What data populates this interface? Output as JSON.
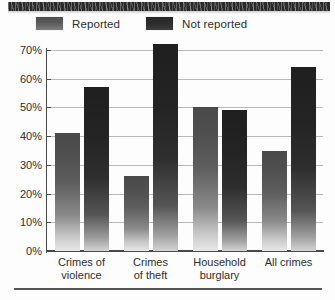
{
  "chart_data": {
    "type": "bar",
    "title": "",
    "subtitle": "",
    "xlabel": "",
    "ylabel": "",
    "categories": [
      "Crimes of violence",
      "Crimes of theft",
      "Household burglary",
      "All crimes"
    ],
    "category_lines": [
      [
        "Crimes of",
        "violence"
      ],
      [
        "Crimes",
        "of theft"
      ],
      [
        "Household",
        "burglary"
      ],
      [
        "All crimes",
        ""
      ]
    ],
    "series": [
      {
        "name": "Reported",
        "values": [
          41,
          26,
          50,
          35
        ],
        "color": "#5a5a5a"
      },
      {
        "name": "Not reported",
        "values": [
          57,
          72,
          49,
          64
        ],
        "color": "#2a2a2a"
      }
    ],
    "ylim": [
      0,
      70
    ],
    "ytick_values": [
      70,
      60,
      50,
      40,
      30,
      20,
      10,
      0
    ],
    "ytick_labels": [
      "70%",
      "60%",
      "50%",
      "40%",
      "30%",
      "20%",
      "10%",
      "0%"
    ],
    "grid": true,
    "grid_axis": "y",
    "legend_position": "top-left",
    "value_unit": "%"
  },
  "legend": {
    "items": [
      {
        "label": "Reported",
        "swatch": "reported-swatch"
      },
      {
        "label": "Not reported",
        "swatch": "not-reported-swatch"
      }
    ]
  }
}
